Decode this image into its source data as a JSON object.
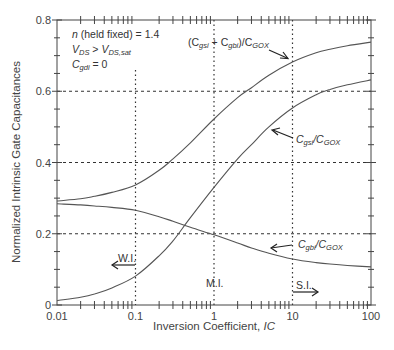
{
  "chart_data": {
    "type": "line",
    "title": "",
    "xlabel": "Inversion Coefficient, IC",
    "xlabel_parts": {
      "text": "Inversion Coefficient, ",
      "italic": "IC"
    },
    "ylabel": "Normalized Intrinsic Gate Capacitances",
    "xscale": "log",
    "xlim": [
      0.01,
      100
    ],
    "ylim": [
      0,
      0.8
    ],
    "x_ticks": [
      0.01,
      0.1,
      1,
      10,
      100
    ],
    "x_tick_labels": [
      "0.01",
      "0.1",
      "1",
      "10",
      "100"
    ],
    "y_ticks": [
      0,
      0.2,
      0.4,
      0.6,
      0.8
    ],
    "y_tick_labels": [
      "0",
      "0.2",
      "0.4",
      "0.6",
      "0.8"
    ],
    "grid": {
      "dotted_vertical": [
        0.1,
        1,
        10
      ],
      "dotted_horizontal": [
        0.2,
        0.4,
        0.6
      ]
    },
    "x": [
      0.01,
      0.02,
      0.03,
      0.05,
      0.1,
      0.2,
      0.3,
      0.5,
      1,
      2,
      3,
      5,
      10,
      20,
      30,
      50,
      100
    ],
    "series": [
      {
        "name": "(Cgsi + Cgbi)/CGOX",
        "values": [
          0.292,
          0.298,
          0.305,
          0.316,
          0.337,
          0.378,
          0.41,
          0.455,
          0.522,
          0.582,
          0.61,
          0.645,
          0.682,
          0.708,
          0.718,
          0.728,
          0.738
        ]
      },
      {
        "name": "Cgsi/CGOX",
        "values": [
          0.012,
          0.022,
          0.031,
          0.048,
          0.081,
          0.138,
          0.18,
          0.245,
          0.33,
          0.41,
          0.45,
          0.5,
          0.553,
          0.59,
          0.605,
          0.618,
          0.632
        ]
      },
      {
        "name": "Cgbi/CGOX",
        "values": [
          0.284,
          0.281,
          0.278,
          0.274,
          0.266,
          0.248,
          0.235,
          0.218,
          0.197,
          0.174,
          0.16,
          0.145,
          0.129,
          0.119,
          0.115,
          0.111,
          0.107
        ]
      }
    ],
    "annotations": [
      {
        "text": "n (held fixed) = 1.4"
      },
      {
        "text": "VDS > VDS,sat"
      },
      {
        "text": "Cgdi = 0"
      },
      {
        "text": "W.I.",
        "arrow": "left",
        "at_x": 0.1
      },
      {
        "text": "M.I.",
        "at_x": 1
      },
      {
        "text": "S.I.",
        "arrow": "right",
        "at_x": 10
      }
    ]
  },
  "labels": {
    "cond1_n": "n",
    "cond1_rest": " (held fixed) = 1.4",
    "cond2_v1": "V",
    "cond2_s1": "DS",
    "cond2_mid": " > ",
    "cond2_v2": "V",
    "cond2_s2": "DS,sat",
    "cond3_c": "C",
    "cond3_s": "gdi",
    "cond3_rest": " = 0",
    "sum_open": "(C",
    "sum_s1": "gsi",
    "sum_plus": " + C",
    "sum_s2": "gbi",
    "sum_close": ")/C",
    "sum_s3": "GOX",
    "cgs_c": "C",
    "cgs_s1": "gsi",
    "cgs_slash": "/C",
    "cgs_s2": "GOX",
    "cgb_c": "C",
    "cgb_s1": "gbi",
    "cgb_slash": "/C",
    "cgb_s2": "GOX",
    "wi": "W.I.",
    "mi": "M.I.",
    "si": "S.I.",
    "xlabel_text": "Inversion Coefficient, ",
    "xlabel_italic": "IC",
    "ylabel": "Normalized Intrinsic Gate Capacitances"
  },
  "colors": {
    "curve": "#555555",
    "axis": "#444444",
    "grid": "#333333",
    "background": "#ffffff"
  }
}
